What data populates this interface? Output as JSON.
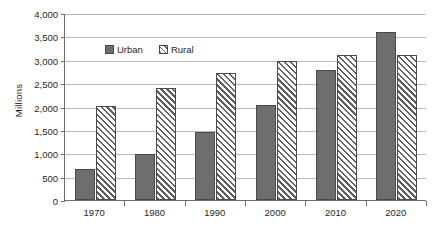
{
  "chart_data": {
    "type": "bar",
    "title": "",
    "subtitle": "",
    "xlabel": "",
    "ylabel": "Millions",
    "categories": [
      "1970",
      "1980",
      "1990",
      "2000",
      "2010",
      "2020"
    ],
    "series": [
      {
        "name": "Urban",
        "values": [
          670,
          990,
          1450,
          2040,
          2780,
          3600
        ],
        "color": "#6e6e6e",
        "fill": "solid-gray"
      },
      {
        "name": "Rural",
        "values": [
          2020,
          2390,
          2720,
          2970,
          3100,
          3100
        ],
        "color": "#5f5f5f",
        "fill": "diagonal-hatch"
      }
    ],
    "ylim": [
      0,
      4000
    ],
    "ytick_values": [
      0,
      500,
      1000,
      1500,
      2000,
      2500,
      3000,
      3500,
      4000
    ],
    "ytick_labels": [
      "0",
      "500",
      "1,000",
      "1,500",
      "2,000",
      "2,500",
      "3,000",
      "3,500",
      "4,000"
    ],
    "grid": true,
    "grid_axis": "y",
    "legend": [
      "Urban",
      "Rural"
    ],
    "legend_position": "inside-top-left",
    "annotations": []
  },
  "legend": {
    "entries": [
      {
        "label": "Urban",
        "swatch": "solid-gray-swatch"
      },
      {
        "label": "Rural",
        "swatch": "hatched-swatch"
      }
    ]
  },
  "axes": {
    "y_title": "Millions"
  }
}
